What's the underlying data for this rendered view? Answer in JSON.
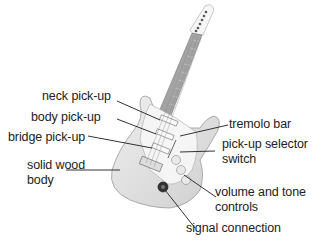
{
  "diagram": {
    "labels": {
      "neck_pickup": "neck pick-up",
      "body_pickup": "body pick-up",
      "bridge_pickup": "bridge pick-up",
      "solid_wood_body_line1": "solid wood",
      "solid_wood_body_line2": "body",
      "tremolo_bar": "tremolo bar",
      "pickup_selector_line1": "pick-up selector",
      "pickup_selector_line2": "switch",
      "volume_tone_line1": "volume and tone",
      "volume_tone_line2": "controls",
      "signal_connection": "signal connection"
    },
    "colors": {
      "body": "#e4e4e4",
      "pickguard": "#f4f4f4",
      "neck": "#9a9a9a",
      "text": "#222222",
      "leader_line": "#333333"
    }
  }
}
